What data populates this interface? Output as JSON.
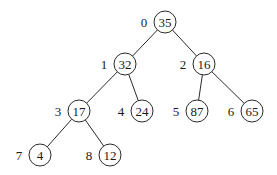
{
  "diagram": {
    "type": "binary-tree",
    "node_radius": 11,
    "stroke_color": "#2a2a2a",
    "nodes": [
      {
        "index": "0",
        "value": "35",
        "x": 165,
        "y": 22
      },
      {
        "index": "1",
        "value": "32",
        "x": 125,
        "y": 64
      },
      {
        "index": "2",
        "value": "16",
        "x": 204,
        "y": 64
      },
      {
        "index": "3",
        "value": "17",
        "x": 79,
        "y": 111
      },
      {
        "index": "4",
        "value": "24",
        "x": 142,
        "y": 111
      },
      {
        "index": "5",
        "value": "87",
        "x": 197,
        "y": 111
      },
      {
        "index": "6",
        "value": "65",
        "x": 252,
        "y": 111
      },
      {
        "index": "7",
        "value": "4",
        "x": 40,
        "y": 155
      },
      {
        "index": "8",
        "value": "12",
        "x": 110,
        "y": 155
      }
    ],
    "edges": [
      {
        "from": 0,
        "to": 1
      },
      {
        "from": 0,
        "to": 2
      },
      {
        "from": 1,
        "to": 3
      },
      {
        "from": 1,
        "to": 4
      },
      {
        "from": 2,
        "to": 5
      },
      {
        "from": 2,
        "to": 6
      },
      {
        "from": 3,
        "to": 7
      },
      {
        "from": 3,
        "to": 8
      }
    ]
  }
}
